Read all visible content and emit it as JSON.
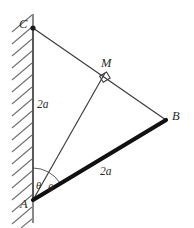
{
  "figure": {
    "type": "geometry-diagram",
    "background_color": "#ffffff",
    "line_color": "#3a3a3a",
    "thick_line_color": "#111111",
    "hatch_color": "#6f6f6f",
    "wall": {
      "name": "hatched-vertical-wall",
      "x": 33,
      "top": 14,
      "bottom": 223,
      "hatch_count": 17,
      "hatch_direction": "lower-left-to-upper-right"
    },
    "points": {
      "A": {
        "label": "A",
        "x": 33,
        "y": 200,
        "label_x": 20,
        "label_y": 198
      },
      "B": {
        "label": "B",
        "x": 166,
        "y": 120,
        "label_x": 172,
        "label_y": 110
      },
      "C": {
        "label": "C",
        "x": 33,
        "y": 28,
        "label_x": 19,
        "label_y": 18
      },
      "M": {
        "label": "M",
        "x": 105,
        "y": 73,
        "label_x": 101,
        "label_y": 57
      }
    },
    "segments": [
      {
        "name": "segment-AC",
        "from": "A",
        "to": "C",
        "style": "thin"
      },
      {
        "name": "segment-CB",
        "from": "C",
        "to": "B",
        "style": "thin"
      },
      {
        "name": "segment-AM",
        "from": "A",
        "to": "M",
        "style": "thin"
      },
      {
        "name": "segment-AB",
        "from": "A",
        "to": "B",
        "style": "thick"
      }
    ],
    "length_labels": [
      {
        "name": "length-AC",
        "text": "2a",
        "x": 37,
        "y": 99
      },
      {
        "name": "length-AB",
        "text": "2a",
        "x": 100,
        "y": 166
      }
    ],
    "angle_labels": [
      {
        "name": "angle-theta-left",
        "text": "θ",
        "x": 36,
        "y": 181
      },
      {
        "name": "angle-theta-right",
        "text": "θ",
        "x": 48,
        "y": 183
      }
    ],
    "markers": {
      "right_angle": {
        "name": "right-angle-marker-at-M",
        "x": 105,
        "y": 73,
        "size": 9
      },
      "vertex_dot": {
        "name": "vertex-dot-C",
        "x": 33,
        "y": 28,
        "r": 2.6
      },
      "angle_arc": {
        "name": "angle-arc-at-A",
        "center_x": 33,
        "center_y": 200,
        "radius": 32
      }
    }
  }
}
